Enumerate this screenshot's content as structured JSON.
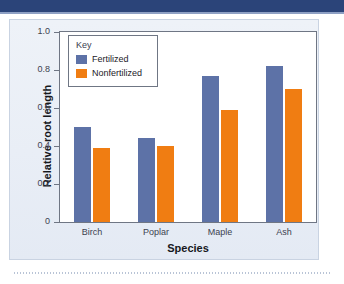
{
  "figure": {
    "header_bar_color": "#2b4479",
    "card_bg": "#edf1f7"
  },
  "legend": {
    "title": "Key",
    "entries": [
      {
        "label": "Fertilized",
        "color": "#5d72a7"
      },
      {
        "label": "Nonfertilized",
        "color": "#f07d12"
      }
    ]
  },
  "axis": {
    "y_title": "Relative root length",
    "x_title": "Species",
    "y_ticks": [
      "1.0",
      "0.8",
      "0.6",
      "0.4",
      "0.2",
      "0"
    ]
  },
  "chart_data": {
    "type": "bar",
    "title": "",
    "xlabel": "Species",
    "ylabel": "Relative root length",
    "categories": [
      "Birch",
      "Poplar",
      "Maple",
      "Ash"
    ],
    "series": [
      {
        "name": "Fertilized",
        "color": "#5d72a7",
        "values": [
          0.5,
          0.44,
          0.77,
          0.82
        ]
      },
      {
        "name": "Nonfertilized",
        "color": "#f07d12",
        "values": [
          0.39,
          0.4,
          0.59,
          0.7
        ]
      }
    ],
    "ylim": [
      0,
      1.0
    ],
    "ytick_values": [
      0,
      0.2,
      0.4,
      0.6,
      0.8,
      1.0
    ],
    "grid": false,
    "legend_position": "upper-left-inside"
  }
}
